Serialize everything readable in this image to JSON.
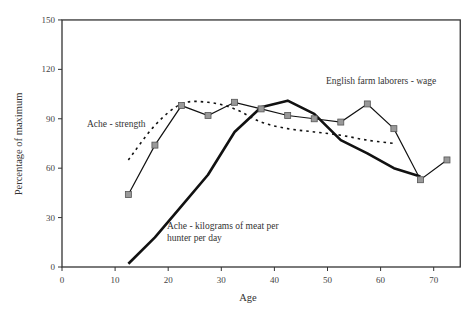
{
  "chart_data": {
    "type": "line",
    "title": "",
    "xlabel": "Age",
    "ylabel": "Percentage of maximum",
    "xlim": [
      0,
      75
    ],
    "ylim": [
      0,
      150
    ],
    "x_ticks": [
      0,
      10,
      20,
      30,
      40,
      50,
      60,
      70
    ],
    "y_ticks": [
      0,
      30,
      60,
      90,
      120,
      150
    ],
    "grid": false,
    "legend": "none (inline annotations)",
    "series": [
      {
        "name": "English farm laborers - wage",
        "style": "thin solid line with gray square markers",
        "x": [
          12.5,
          17.5,
          22.5,
          27.5,
          32.5,
          37.5,
          42.5,
          47.5,
          52.5,
          57.5,
          62.5,
          67.5,
          72.5
        ],
        "values": [
          44,
          74,
          98,
          92,
          100,
          96,
          92,
          90,
          88,
          99,
          84,
          53,
          65
        ]
      },
      {
        "name": "Ache - strength",
        "style": "dotted curve",
        "x": [
          12.5,
          17.5,
          22.5,
          27.5,
          32.5,
          37.5,
          42.5,
          47.5,
          52.5,
          57.5,
          62.5
        ],
        "values": [
          65,
          86,
          99,
          100,
          96,
          88,
          84,
          82,
          80,
          77,
          75
        ]
      },
      {
        "name": "Ache - kilograms of meat per hunter per day",
        "style": "thick solid line",
        "x": [
          12.5,
          17.5,
          22.5,
          27.5,
          32.5,
          37.5,
          42.5,
          47.5,
          52.5,
          57.5,
          62.5,
          67.5
        ],
        "values": [
          2,
          18,
          37,
          56,
          82,
          97,
          101,
          93,
          77,
          69,
          60,
          55
        ]
      }
    ],
    "annotations": [
      {
        "text": "English farm laborers - wage",
        "x": 49,
        "y": 107
      },
      {
        "text": "Ache - strength",
        "x": 4,
        "y": 88
      },
      {
        "text": "Ache - kilograms of meat per",
        "x": 22,
        "y": 36
      },
      {
        "text": "hunter per day",
        "x": 22,
        "y": 29
      }
    ]
  },
  "labels": {
    "xlabel": "Age",
    "ylabel": "Percentage of maximum",
    "wage": "English farm laborers - wage",
    "strength": "Ache - strength",
    "meat_line1": "Ache - kilograms of meat per",
    "meat_line2": "hunter per day"
  },
  "colors": {
    "axis": "#333333",
    "line": "#111111",
    "marker_fill": "#999999",
    "marker_stroke": "#555555"
  }
}
